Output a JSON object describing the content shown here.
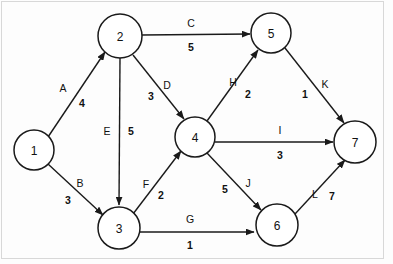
{
  "diagram": {
    "canvas": {
      "width": 393,
      "height": 264
    },
    "style": {
      "background_color": "#fdfdfd",
      "stroke_color": "#1a1a1a",
      "text_color": "#111111",
      "border_color": "#d8d8d8",
      "node_radius": 21
    },
    "nodes": [
      {
        "id": "1",
        "label": "1",
        "cx": 34,
        "cy": 150,
        "r": 20
      },
      {
        "id": "2",
        "label": "2",
        "cx": 120,
        "cy": 36,
        "r": 22
      },
      {
        "id": "3",
        "label": "3",
        "cx": 119,
        "cy": 228,
        "r": 21
      },
      {
        "id": "4",
        "label": "4",
        "cx": 195,
        "cy": 137,
        "r": 20
      },
      {
        "id": "5",
        "label": "5",
        "cx": 271,
        "cy": 33,
        "r": 20
      },
      {
        "id": "6",
        "label": "6",
        "cx": 277,
        "cy": 225,
        "r": 21
      },
      {
        "id": "7",
        "label": "7",
        "cx": 355,
        "cy": 142,
        "r": 21
      }
    ],
    "edges": [
      {
        "name": "A",
        "weight": "4",
        "from": "1",
        "to": "2",
        "x1": 48,
        "y1": 137,
        "x2": 105,
        "y2": 52,
        "name_x": 63,
        "name_y": 88,
        "weight_x": 82,
        "weight_y": 103
      },
      {
        "name": "B",
        "weight": "3",
        "from": "1",
        "to": "3",
        "x1": 48,
        "y1": 164,
        "x2": 103,
        "y2": 215,
        "name_x": 80,
        "name_y": 183,
        "weight_x": 68,
        "weight_y": 200
      },
      {
        "name": "C",
        "weight": "5",
        "from": "2",
        "to": "5",
        "x1": 142,
        "y1": 35,
        "x2": 250,
        "y2": 34,
        "name_x": 191,
        "name_y": 23,
        "weight_x": 191,
        "weight_y": 47
      },
      {
        "name": "D",
        "weight": "3",
        "from": "2",
        "to": "4",
        "x1": 133,
        "y1": 55,
        "x2": 184,
        "y2": 119,
        "name_x": 167,
        "name_y": 85,
        "weight_x": 151,
        "weight_y": 96
      },
      {
        "name": "E",
        "weight": "5",
        "from": "2",
        "to": "3",
        "x1": 120,
        "y1": 58,
        "x2": 119,
        "y2": 205,
        "name_x": 107,
        "name_y": 131,
        "weight_x": 131,
        "weight_y": 131
      },
      {
        "name": "F",
        "weight": "2",
        "from": "3",
        "to": "4",
        "x1": 133,
        "y1": 214,
        "x2": 181,
        "y2": 151,
        "name_x": 146,
        "name_y": 184,
        "weight_x": 161,
        "weight_y": 195
      },
      {
        "name": "G",
        "weight": "1",
        "from": "3",
        "to": "6",
        "x1": 140,
        "y1": 232,
        "x2": 254,
        "y2": 232,
        "name_x": 190,
        "name_y": 219,
        "weight_x": 190,
        "weight_y": 245
      },
      {
        "name": "H",
        "weight": "2",
        "from": "4",
        "to": "5",
        "x1": 207,
        "y1": 121,
        "x2": 258,
        "y2": 50,
        "name_x": 233,
        "name_y": 82,
        "weight_x": 248,
        "weight_y": 94
      },
      {
        "name": "I",
        "weight": "3",
        "from": "4",
        "to": "7",
        "x1": 215,
        "y1": 142,
        "x2": 333,
        "y2": 142,
        "name_x": 280,
        "name_y": 130,
        "weight_x": 280,
        "weight_y": 155
      },
      {
        "name": "J",
        "weight": "5",
        "from": "4",
        "to": "6",
        "x1": 207,
        "y1": 153,
        "x2": 261,
        "y2": 210,
        "name_x": 248,
        "name_y": 183,
        "weight_x": 225,
        "weight_y": 189
      },
      {
        "name": "K",
        "weight": "1",
        "from": "5",
        "to": "7",
        "x1": 285,
        "y1": 48,
        "x2": 344,
        "y2": 123,
        "name_x": 325,
        "name_y": 84,
        "weight_x": 305,
        "weight_y": 94
      },
      {
        "name": "L",
        "weight": "7",
        "from": "6",
        "to": "7",
        "x1": 295,
        "y1": 214,
        "x2": 345,
        "y2": 160,
        "name_x": 315,
        "name_y": 194,
        "weight_x": 332,
        "weight_y": 196
      }
    ]
  }
}
